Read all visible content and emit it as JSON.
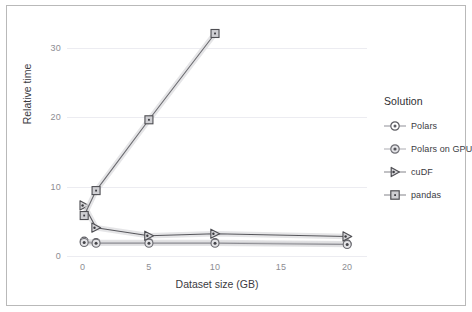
{
  "chart_data": {
    "type": "line",
    "title": "",
    "xlabel": "Dataset size (GB)",
    "ylabel": "Relative time",
    "xlim": [
      -1.2,
      21.5
    ],
    "ylim": [
      -1.0,
      34.0
    ],
    "xticks": [
      0,
      5,
      10,
      15,
      20
    ],
    "yticks": [
      0,
      10,
      20,
      30
    ],
    "xtick_labels": [
      "0",
      "5",
      "10",
      "15",
      "20"
    ],
    "ytick_labels": [
      "0",
      "10",
      "20",
      "30"
    ],
    "grid": "horizontal",
    "legend_position": "right",
    "legend_title": "Solution",
    "series": [
      {
        "name": "Polars",
        "marker": "circle-dot",
        "color": "#6f6f75",
        "x": [
          0.1,
          1,
          5,
          10,
          20
        ],
        "y": [
          1.2,
          1.0,
          1.0,
          1.0,
          0.8
        ]
      },
      {
        "name": "Polars on GPU",
        "marker": "circle-dot-filled",
        "color": "#8d8d93",
        "x": [
          0.1,
          1,
          5,
          10,
          20
        ],
        "y": [
          1.0,
          0.9,
          0.9,
          0.9,
          0.7
        ]
      },
      {
        "name": "cuDF",
        "marker": "triangle-right",
        "color": "#57575c",
        "x": [
          0.1,
          1,
          5,
          10,
          20
        ],
        "y": [
          6.5,
          3.2,
          2.0,
          2.3,
          1.9
        ]
      },
      {
        "name": "pandas",
        "marker": "square-dot",
        "color": "#6b6b70",
        "x": [
          0.1,
          1,
          5,
          10
        ],
        "y": [
          5.0,
          8.7,
          19.2,
          32.0
        ]
      }
    ]
  },
  "legend": {
    "title": "Solution",
    "items": [
      {
        "label": "Polars"
      },
      {
        "label": "Polars on GPU"
      },
      {
        "label": "cuDF"
      },
      {
        "label": "pandas"
      }
    ]
  },
  "axes": {
    "x_title": "Dataset size (GB)",
    "y_title": "Relative time"
  },
  "colors": {
    "grid": "#ececf1",
    "tick_text": "#8d8d93",
    "axis_title": "#3b3b3f",
    "frame": "#b9b9b9",
    "line": "#6f6f75",
    "band": "#dcdcdf"
  }
}
